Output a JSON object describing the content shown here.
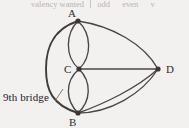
{
  "header_strip": {
    "valency_label": "valency wanted",
    "odd_label": "odd",
    "even_label": "even",
    "tail_label": "v"
  },
  "figure": {
    "bridge_annotation": "9th bridge",
    "background_color": "#f3f1ef",
    "line_color": "#4a4644",
    "node_color": "#3a3634",
    "nodes": [
      {
        "id": "A",
        "label": "A",
        "x": 78,
        "y": 21,
        "label_x": 68,
        "label_y": 17
      },
      {
        "id": "C",
        "label": "C",
        "x": 79,
        "y": 69,
        "label_x": 65,
        "label_y": 72
      },
      {
        "id": "D",
        "label": "D",
        "x": 158,
        "y": 69,
        "label_x": 167,
        "label_y": 72
      },
      {
        "id": "B",
        "label": "B",
        "x": 78,
        "y": 113,
        "label_x": 69,
        "label_y": 126
      }
    ],
    "edges": [
      {
        "from": "A",
        "to": "C",
        "kind": "curve-left",
        "note": "A-C left arc"
      },
      {
        "from": "A",
        "to": "C",
        "kind": "curve-right",
        "note": "A-C right arc"
      },
      {
        "from": "C",
        "to": "B",
        "kind": "curve-left",
        "note": "C-B left arc"
      },
      {
        "from": "C",
        "to": "B",
        "kind": "curve-right",
        "note": "C-B right arc"
      },
      {
        "from": "A",
        "to": "B",
        "kind": "outer-arc",
        "note": "9th bridge, large left arc"
      },
      {
        "from": "A",
        "to": "D",
        "kind": "curve-upper",
        "note": "A-D arc"
      },
      {
        "from": "C",
        "to": "D",
        "kind": "straight",
        "note": "C-D straight"
      },
      {
        "from": "B",
        "to": "D",
        "kind": "curve-upper",
        "note": "B-D upper arc"
      },
      {
        "from": "B",
        "to": "D",
        "kind": "curve-lower",
        "note": "B-D lower arc"
      }
    ]
  }
}
